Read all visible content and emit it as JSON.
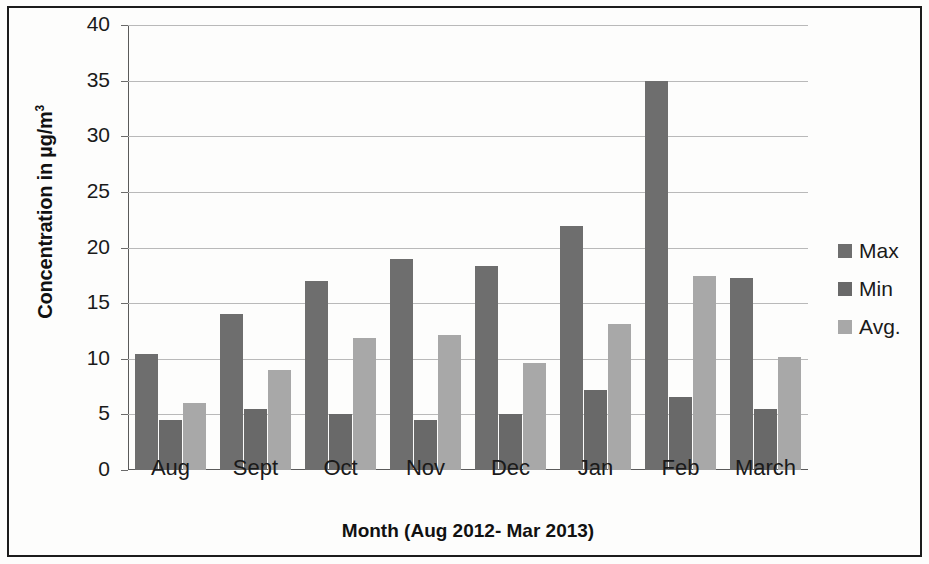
{
  "chart_data": {
    "type": "bar",
    "title": "",
    "xlabel": "Month (Aug 2012- Mar 2013)",
    "ylabel": "Concentration in µg/m³",
    "ylabel_main": "Concentration in µg/m",
    "ylabel_exponent": "3",
    "categories": [
      "Aug",
      "Sept",
      "Oct",
      "Nov",
      "Dec",
      "Jan",
      "Feb",
      "March"
    ],
    "series": [
      {
        "name": "Max",
        "color": "#6e6e6e",
        "values": [
          10.4,
          14.0,
          17.0,
          19.0,
          18.3,
          21.9,
          35.0,
          17.3
        ]
      },
      {
        "name": "Min",
        "color": "#696969",
        "values": [
          4.5,
          5.5,
          5.0,
          4.5,
          5.0,
          7.2,
          6.6,
          5.5
        ]
      },
      {
        "name": "Avg.",
        "color": "#a8a8a8",
        "values": [
          6.0,
          9.0,
          11.9,
          12.1,
          9.6,
          13.1,
          17.4,
          10.2
        ]
      }
    ],
    "ylim": [
      0,
      40
    ],
    "yticks": [
      0,
      5,
      10,
      15,
      20,
      25,
      30,
      35,
      40
    ],
    "ytick_labels": [
      "0",
      "5",
      "10",
      "15",
      "20",
      "25",
      "30",
      "35",
      "40"
    ],
    "grid": true,
    "legend_position": "right",
    "legend_entries": [
      "Max",
      "Min",
      "Avg."
    ]
  }
}
